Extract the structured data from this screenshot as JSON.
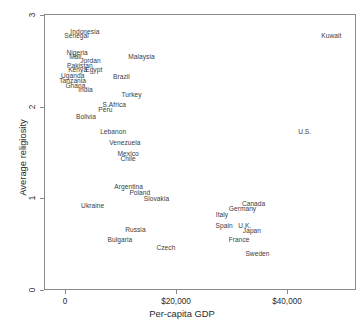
{
  "chart_data": {
    "type": "scatter",
    "title": "",
    "xlabel": "Per-capita GDP",
    "ylabel": "Average religiosity",
    "xlim": [
      -3800,
      52500
    ],
    "ylim": [
      0,
      3
    ],
    "grid": false,
    "legend": null,
    "marker_style": "text-label",
    "x_ticks": [
      {
        "value": 0,
        "label": "0"
      },
      {
        "value": 20000,
        "label": "$20,000"
      },
      {
        "value": 40000,
        "label": "$40,000"
      }
    ],
    "y_ticks": [
      {
        "value": 0,
        "label": "0"
      },
      {
        "value": 1,
        "label": "1"
      },
      {
        "value": 2,
        "label": "2"
      },
      {
        "value": 3,
        "label": "3"
      }
    ],
    "points": [
      {
        "label": "Indonesia",
        "x": 3400,
        "y": 2.83
      },
      {
        "label": "Senegal",
        "x": 1900,
        "y": 2.78
      },
      {
        "label": "Nigeria",
        "x": 2000,
        "y": 2.6
      },
      {
        "label": "Mali",
        "x": 1700,
        "y": 2.55
      },
      {
        "label": "Jordan",
        "x": 4400,
        "y": 2.51
      },
      {
        "label": "Malaysia",
        "x": 13600,
        "y": 2.55
      },
      {
        "label": "Pakistan",
        "x": 2500,
        "y": 2.46
      },
      {
        "label": "Kenya",
        "x": 2100,
        "y": 2.41
      },
      {
        "label": "Egypt",
        "x": 5000,
        "y": 2.41
      },
      {
        "label": "Uganda",
        "x": 1200,
        "y": 2.35
      },
      {
        "label": "Brazil",
        "x": 10000,
        "y": 2.34
      },
      {
        "label": "Tanzania",
        "x": 1200,
        "y": 2.29
      },
      {
        "label": "Ghana",
        "x": 1700,
        "y": 2.24
      },
      {
        "label": "India",
        "x": 3500,
        "y": 2.19
      },
      {
        "label": "Turkey",
        "x": 11800,
        "y": 2.14
      },
      {
        "label": "S.Africa",
        "x": 8700,
        "y": 2.03
      },
      {
        "label": "Peru",
        "x": 7100,
        "y": 1.97
      },
      {
        "label": "Bolivia",
        "x": 3600,
        "y": 1.9
      },
      {
        "label": "Lebanon",
        "x": 8500,
        "y": 1.73
      },
      {
        "label": "U.S.",
        "x": 43000,
        "y": 1.73
      },
      {
        "label": "Venezuela",
        "x": 10600,
        "y": 1.62
      },
      {
        "label": "Mexico",
        "x": 11200,
        "y": 1.5
      },
      {
        "label": "Chile",
        "x": 11200,
        "y": 1.44
      },
      {
        "label": "Argentina",
        "x": 11300,
        "y": 1.13
      },
      {
        "label": "Poland",
        "x": 13300,
        "y": 1.07
      },
      {
        "label": "Slovakia",
        "x": 16300,
        "y": 1.0
      },
      {
        "label": "Ukraine",
        "x": 4800,
        "y": 0.93
      },
      {
        "label": "Canada",
        "x": 33800,
        "y": 0.95
      },
      {
        "label": "Germany",
        "x": 31800,
        "y": 0.9
      },
      {
        "label": "Italy",
        "x": 28100,
        "y": 0.83
      },
      {
        "label": "Spain",
        "x": 28500,
        "y": 0.71
      },
      {
        "label": "U.K.",
        "x": 32200,
        "y": 0.71
      },
      {
        "label": "Japan",
        "x": 33500,
        "y": 0.66
      },
      {
        "label": "Russia",
        "x": 12500,
        "y": 0.67
      },
      {
        "label": "Bulgaria",
        "x": 9700,
        "y": 0.56
      },
      {
        "label": "France",
        "x": 31200,
        "y": 0.56
      },
      {
        "label": "Czech",
        "x": 18000,
        "y": 0.47
      },
      {
        "label": "Sweden",
        "x": 34500,
        "y": 0.4
      },
      {
        "label": "Kuwait",
        "x": 47800,
        "y": 2.78
      }
    ]
  }
}
